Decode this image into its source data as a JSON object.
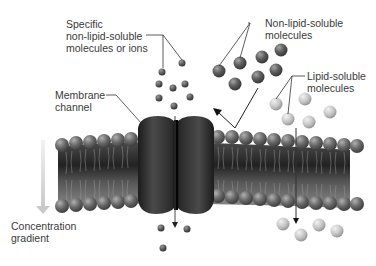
{
  "diagram": {
    "labels": {
      "specific_ions": [
        "Specific",
        "non-lipid-soluble",
        "molecules or ions"
      ],
      "membrane_channel": [
        "Membrane",
        "channel"
      ],
      "non_lipid_soluble": [
        "Non-lipid-soluble",
        "molecules"
      ],
      "lipid_soluble": [
        "Lipid-soluble",
        "molecules"
      ],
      "concentration_gradient": [
        "Concentration",
        "gradient"
      ]
    },
    "colors": {
      "membrane_dark": "#2a2a2a",
      "phospholipid_head": "#6e6e6e",
      "channel_protein": "#262626",
      "ion": "#555555",
      "non_lipid_molecule": "#5a5a5a",
      "lipid_molecule": "#c4c4c4",
      "gradient_arrow": "#d4d4d4",
      "text": "#3a3a3a"
    }
  }
}
